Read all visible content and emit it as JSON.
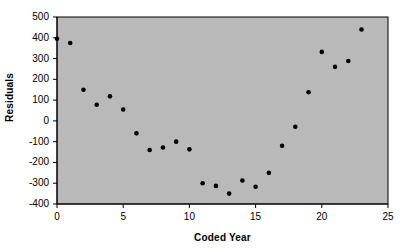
{
  "chart_data": {
    "type": "scatter",
    "title": "",
    "xlabel": "Coded Year",
    "ylabel": "Residuals",
    "xlim": [
      0,
      25
    ],
    "ylim": [
      -400,
      500
    ],
    "xticks": [
      "0",
      "5",
      "10",
      "15",
      "20",
      "25"
    ],
    "xtick_values": [
      0,
      5,
      10,
      15,
      20,
      25
    ],
    "yticks": [
      "500",
      "400",
      "300",
      "200",
      "100",
      "0",
      "-100",
      "-200",
      "-300",
      "-400"
    ],
    "ytick_values": [
      500,
      400,
      300,
      200,
      100,
      0,
      -100,
      -200,
      -300,
      -400
    ],
    "grid": false,
    "legend": false,
    "legend_position": "none",
    "marker": "filled-circle",
    "marker_color": "#000000",
    "plot_background": "#b9b9b9",
    "series": [
      {
        "name": "Residuals",
        "x": [
          0,
          1,
          2,
          3,
          4,
          5,
          6,
          7,
          8,
          9,
          10,
          11,
          12,
          13,
          14,
          15,
          16,
          17,
          18,
          19,
          20,
          21,
          22,
          23
        ],
        "values": [
          395,
          375,
          150,
          78,
          118,
          55,
          -60,
          -140,
          -128,
          -100,
          -137,
          -300,
          -313,
          -350,
          -287,
          -317,
          -250,
          -120,
          -28,
          138,
          332,
          260,
          288,
          440
        ]
      }
    ]
  }
}
